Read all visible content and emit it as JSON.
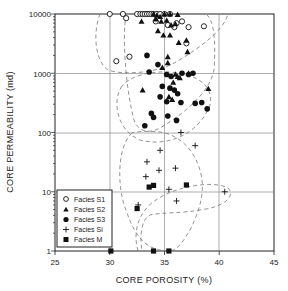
{
  "chart_data": {
    "type": "scatter",
    "title": "",
    "xlabel": "CORE POROSITY (%)",
    "ylabel": "CORE PERMEABILITY (md)",
    "xlim": [
      25,
      45
    ],
    "ylim": [
      1,
      10000
    ],
    "yscale": "log",
    "xticks": [
      25,
      30,
      35,
      40,
      45
    ],
    "yticks": [
      1,
      10,
      100,
      1000,
      10000
    ],
    "xtick_labels": [
      "25",
      "30",
      "35",
      "40",
      "45"
    ],
    "ytick_labels": [
      "1",
      "10",
      "100",
      "1000",
      "10000"
    ],
    "grid": true,
    "legend_position": "lower left",
    "series": [
      {
        "name": "Facies S1",
        "marker": "open-circle",
        "points": [
          [
            30.0,
            10000
          ],
          [
            31.2,
            10000
          ],
          [
            31.5,
            8500
          ],
          [
            32.5,
            10000
          ],
          [
            32.8,
            10000
          ],
          [
            33.0,
            10000
          ],
          [
            33.2,
            10000
          ],
          [
            33.4,
            10000
          ],
          [
            33.6,
            10000
          ],
          [
            33.8,
            10000
          ],
          [
            34.0,
            10000
          ],
          [
            34.3,
            10000
          ],
          [
            34.6,
            10000
          ],
          [
            35.0,
            10000
          ],
          [
            35.5,
            10000
          ],
          [
            34.2,
            7500
          ],
          [
            35.3,
            6500
          ],
          [
            35.9,
            6000
          ],
          [
            36.6,
            7500
          ],
          [
            37.2,
            6000
          ],
          [
            38.6,
            6200
          ],
          [
            37.0,
            3200
          ],
          [
            36.1,
            7000
          ],
          [
            30.6,
            1600
          ],
          [
            31.8,
            1900
          ]
        ]
      },
      {
        "name": "Facies S2",
        "marker": "filled-triangle",
        "points": [
          [
            32.9,
            7500
          ],
          [
            34.0,
            10000
          ],
          [
            34.3,
            9500
          ],
          [
            34.6,
            9000
          ],
          [
            35.0,
            10000
          ],
          [
            35.5,
            10000
          ],
          [
            36.2,
            9800
          ],
          [
            34.2,
            8200
          ],
          [
            34.7,
            7500
          ],
          [
            35.2,
            7800
          ],
          [
            36.0,
            6800
          ],
          [
            35.6,
            6500
          ],
          [
            34.4,
            5200
          ],
          [
            34.9,
            4400
          ],
          [
            35.5,
            4400
          ],
          [
            36.3,
            3300
          ],
          [
            37.0,
            3600
          ],
          [
            37.1,
            2300
          ],
          [
            35.3,
            1900
          ],
          [
            35.3,
            1500
          ],
          [
            36.0,
            960
          ],
          [
            36.2,
            880
          ],
          [
            36.4,
            840
          ],
          [
            35.8,
            700
          ],
          [
            34.8,
            1250
          ],
          [
            37.2,
            1000
          ],
          [
            39.0,
            550
          ],
          [
            33.0,
            520
          ],
          [
            35.4,
            400
          ],
          [
            35.7,
            360
          ]
        ]
      },
      {
        "name": "Facies S3",
        "marker": "filled-circle",
        "points": [
          [
            33.4,
            2000
          ],
          [
            34.4,
            1400
          ],
          [
            33.6,
            1050
          ],
          [
            36.6,
            1000
          ],
          [
            37.2,
            950
          ],
          [
            37.6,
            1000
          ],
          [
            35.2,
            950
          ],
          [
            35.6,
            880
          ],
          [
            34.8,
            600
          ],
          [
            35.5,
            560
          ],
          [
            35.9,
            520
          ],
          [
            36.2,
            450
          ],
          [
            34.6,
            400
          ],
          [
            35.2,
            330
          ],
          [
            36.5,
            320
          ],
          [
            37.8,
            310
          ],
          [
            38.4,
            320
          ],
          [
            38.9,
            250
          ],
          [
            33.8,
            210
          ],
          [
            35.3,
            190
          ],
          [
            36.1,
            160
          ],
          [
            33.2,
            130
          ],
          [
            34.0,
            180
          ]
        ]
      },
      {
        "name": "Facies Si",
        "marker": "plus",
        "points": [
          [
            36.5,
            100
          ],
          [
            37.8,
            60
          ],
          [
            34.6,
            50
          ],
          [
            33.4,
            32
          ],
          [
            34.5,
            23
          ],
          [
            33.3,
            18
          ],
          [
            36.0,
            25
          ],
          [
            35.4,
            11
          ],
          [
            36.1,
            7
          ],
          [
            40.5,
            10
          ],
          [
            32.6,
            6
          ]
        ]
      },
      {
        "name": "Facies M",
        "marker": "filled-square",
        "points": [
          [
            33.6,
            12
          ],
          [
            35.4,
            1
          ],
          [
            34.0,
            1
          ],
          [
            37.0,
            13
          ],
          [
            34.0,
            12.8
          ],
          [
            32.5,
            5.2
          ],
          [
            30.1,
            1
          ]
        ]
      }
    ],
    "annotations": "Dashed envelope outlines enclose each facies cluster"
  },
  "legend": {
    "items": [
      {
        "label": "Facies S1",
        "marker": "open-circle"
      },
      {
        "label": "Facies S2",
        "marker": "filled-triangle"
      },
      {
        "label": "Facies S3",
        "marker": "filled-circle"
      },
      {
        "label": "Facies Si",
        "marker": "plus"
      },
      {
        "label": "Facies M",
        "marker": "filled-square"
      }
    ]
  },
  "axes": {
    "x_title": "CORE POROSITY (%)",
    "y_title": "CORE PERMEABILITY (md)",
    "x_labels": [
      "25",
      "30",
      "35",
      "40",
      "45"
    ],
    "y_labels": [
      "10000",
      "1000",
      "100",
      "10",
      "1"
    ]
  }
}
